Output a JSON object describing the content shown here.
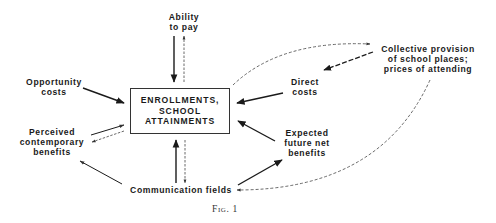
{
  "diagram": {
    "center": {
      "lines": [
        "ENROLLMENTS,",
        "SCHOOL",
        "ATTAINMENTS"
      ]
    },
    "nodes": {
      "ability_to_pay": {
        "lines": [
          "Ability",
          "to pay"
        ]
      },
      "opportunity_costs": {
        "lines": [
          "Opportunity",
          "costs"
        ]
      },
      "perceived_benefits": {
        "lines": [
          "Perceived",
          "contemporary",
          "benefits"
        ]
      },
      "communication_fields": {
        "lines": [
          "Communication fields"
        ]
      },
      "direct_costs": {
        "lines": [
          "Direct",
          "costs"
        ]
      },
      "collective_provision": {
        "lines": [
          "Collective provision",
          "of school places;",
          "prices of attending"
        ]
      },
      "expected_benefits": {
        "lines": [
          "Expected",
          "future net",
          "benefits"
        ]
      }
    },
    "edges": [
      {
        "from": "ability_to_pay",
        "to": "center",
        "style": "solid"
      },
      {
        "from": "center",
        "to": "ability_to_pay",
        "style": "dashed"
      },
      {
        "from": "opportunity_costs",
        "to": "center",
        "style": "solid"
      },
      {
        "from": "perceived_benefits",
        "to": "center",
        "style": "solid"
      },
      {
        "from": "center",
        "to": "perceived_benefits",
        "style": "dashed"
      },
      {
        "from": "communication_fields",
        "to": "center",
        "style": "solid"
      },
      {
        "from": "center",
        "to": "communication_fields",
        "style": "dashed"
      },
      {
        "from": "communication_fields",
        "to": "perceived_benefits",
        "style": "solid"
      },
      {
        "from": "direct_costs",
        "to": "center",
        "style": "solid"
      },
      {
        "from": "expected_benefits",
        "to": "center",
        "style": "solid"
      },
      {
        "from": "communication_fields",
        "to": "expected_benefits",
        "style": "solid"
      },
      {
        "from": "collective_provision",
        "to": "direct_costs",
        "style": "dashed"
      },
      {
        "from": "center",
        "to": "collective_provision",
        "style": "dashed-curve"
      },
      {
        "from": "collective_provision",
        "to": "communication_fields",
        "style": "dashed-curve"
      }
    ],
    "caption": "Fig. 1"
  },
  "colors": {
    "ink": "#1a1a1a",
    "background": "#ffffff"
  }
}
